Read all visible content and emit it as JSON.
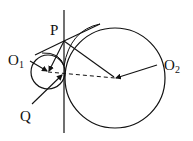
{
  "diagram": {
    "labels": {
      "P": "P",
      "O1_main": "O",
      "O1_sub": "1",
      "O2_main": "O",
      "O2_sub": "2",
      "Q": "Q"
    },
    "colors": {
      "stroke": "#111111",
      "background": "#ffffff"
    },
    "elements": {
      "vertical_line": {
        "x": 64,
        "y1": 10,
        "y2": 133
      },
      "small_circle": {
        "cx": 48,
        "cy": 72,
        "r": 17
      },
      "large_circle": {
        "cx": 115,
        "cy": 78,
        "r": 50
      },
      "point_P": {
        "x": 64,
        "y": 41
      },
      "dashed_center_line": {
        "from": "O1",
        "to": "O2"
      }
    }
  }
}
